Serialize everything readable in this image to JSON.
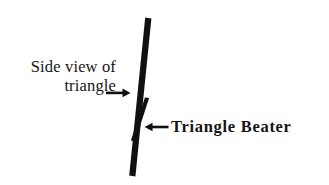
{
  "figure": {
    "background_color": "#ffffff",
    "ink_color": "#111111",
    "width": 329,
    "height": 185,
    "labels": {
      "triangle_line1": "Side view of",
      "triangle_line2": "triangle",
      "beater": "Triangle Beater"
    },
    "shapes": {
      "triangle_bar": {
        "name": "side-view-of-triangle-bar",
        "top": [
          148,
          18
        ],
        "bottom": [
          132,
          176
        ],
        "thickness": 6,
        "color": "#111111"
      },
      "beater_bar": {
        "name": "triangle-beater-bar",
        "top": [
          147,
          98
        ],
        "bottom": [
          133,
          141
        ],
        "thickness": 4,
        "color": "#111111"
      }
    },
    "arrows": {
      "to_triangle": {
        "name": "arrow-pointing-right-to-triangle",
        "direction": "right",
        "from": [
          106,
          93
        ],
        "to": [
          130,
          93
        ]
      },
      "to_beater": {
        "name": "arrow-pointing-left-to-beater",
        "direction": "left",
        "from": [
          168,
          127
        ],
        "to": [
          146,
          127
        ]
      }
    }
  }
}
